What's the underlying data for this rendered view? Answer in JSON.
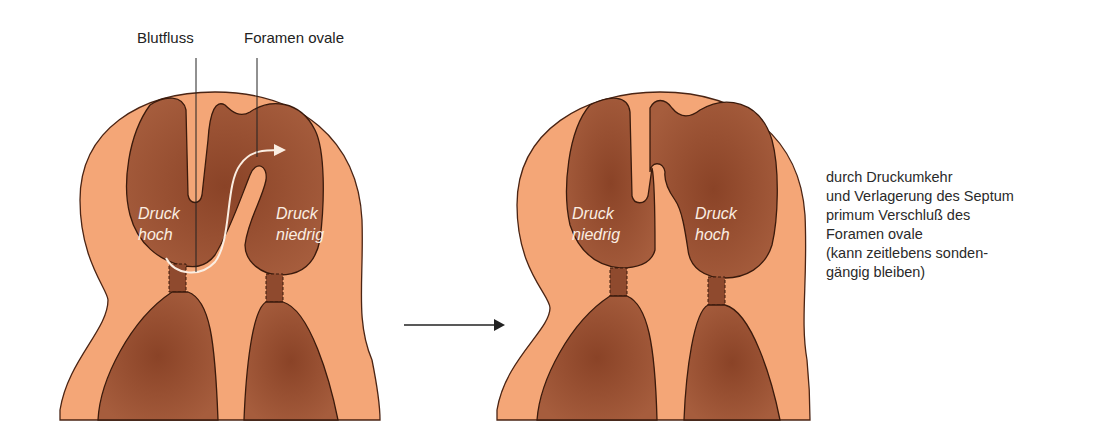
{
  "diagram": {
    "colors": {
      "outer_tissue": "#f4a677",
      "chamber": "#9b5234",
      "outline": "#4a2414",
      "inner_text": "#fbeee2",
      "arrow": "#222222"
    },
    "left_panel": {
      "labels": {
        "blood_flow": "Blutfluss",
        "foramen_ovale": "Foramen ovale"
      },
      "left_chamber": {
        "line1": "Druck",
        "line2": "hoch"
      },
      "right_chamber": {
        "line1": "Druck",
        "line2": "niedrig"
      }
    },
    "right_panel": {
      "left_chamber": {
        "line1": "Druck",
        "line2": "niedrig"
      },
      "right_chamber": {
        "line1": "Druck",
        "line2": "hoch"
      }
    },
    "transition_arrow": "arrow-right",
    "caption": {
      "lines": [
        "durch Druckumkehr",
        "und Verlagerung des Septum",
        "primum Verschluß des",
        "Foramen ovale",
        "(kann zeitlebens sonden-",
        "gängig bleiben)"
      ]
    }
  }
}
